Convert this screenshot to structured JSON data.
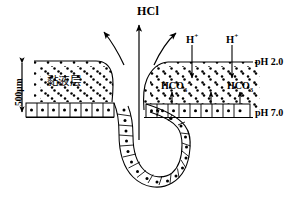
{
  "figure": {
    "title_label": "HCl",
    "background_color": "#ffffff",
    "stroke_color": "#000000"
  },
  "labels": {
    "hcl": "HCl",
    "hydrogen_ion_left": "H",
    "hydrogen_ion_left_charge": "+",
    "hydrogen_ion_right": "H",
    "hydrogen_ion_right_charge": "+",
    "bicarbonate_left_base": "HCO",
    "bicarbonate_left_sub": "3",
    "bicarbonate_left_sup": "-",
    "bicarbonate_right_base": "HCO",
    "bicarbonate_right_sub": "3",
    "bicarbonate_right_sup": "-",
    "ph_top": "pH 2.0",
    "ph_bottom": "pH 7.0",
    "mucus_layer": "黏液层",
    "scale": "500μm"
  },
  "structures": {
    "mucus_layer_name": "mucus-layer",
    "epithelium_name": "epithelial-cell-layer",
    "gastric_pit_name": "gastric-pit",
    "ph_gradient_top_name": "ph-2-boundary-line",
    "ph_gradient_bottom_name": "ph-7-boundary-line"
  },
  "arrows": {
    "hcl_center": "upward-straight-arrow",
    "hcl_left_curve": "upward-left-curved-arrow",
    "hcl_right_curve": "upward-right-curved-arrow",
    "h_down_left": "downward-arrow",
    "h_down_right": "downward-arrow",
    "hco3_up_left": "upward-arrow",
    "hco3_up_mid": "upward-arrow",
    "hco3_up_right": "upward-arrow",
    "scale_bar": "double-headed-vertical-arrow"
  }
}
